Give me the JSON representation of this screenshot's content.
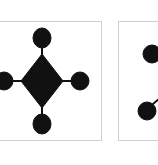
{
  "figure": {
    "panels": [
      {
        "id": "left",
        "shape": "diamond-with-four-nodes",
        "center_shape": "diamond",
        "nodes": [
          "top",
          "right",
          "bottom",
          "left"
        ],
        "fill_color": "#111111"
      },
      {
        "id": "right",
        "shape": "two-nodes-partial",
        "nodes": [
          "upper",
          "lower"
        ],
        "fill_color": "#111111"
      }
    ],
    "border_color": "#cfcfcf",
    "background": "#ffffff"
  }
}
